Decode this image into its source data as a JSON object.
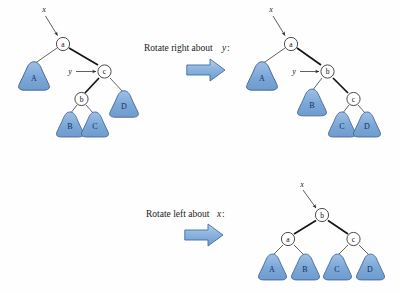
{
  "figure": {
    "background_color": "#ffffff",
    "subtree_fill_color": "#7ba7d7",
    "subtree_stroke_color": "#3c5f90",
    "arrow_fill_color": "#8cb4de",
    "arrow_stroke_color": "#3f6ea8",
    "node_fill_color": "#ffffff",
    "node_stroke_color": "#2e2e2e"
  },
  "captions": {
    "step1": "Rotate right about",
    "step1_var": "y",
    "step1_colon": ":",
    "step1_full": "Rotate right about y:",
    "step2": "Rotate left about",
    "step2_var": "x",
    "step2_colon": ":",
    "step2_full": "Rotate left about x:"
  },
  "trees": {
    "before": {
      "name": "initial-tree",
      "pointers": [
        {
          "label": "x",
          "target": "a"
        },
        {
          "label": "y",
          "target": "c"
        }
      ],
      "nodes": [
        {
          "id": "a",
          "label": "a"
        },
        {
          "id": "c",
          "label": "c"
        },
        {
          "id": "b",
          "label": "b"
        }
      ],
      "subtrees": [
        {
          "id": "A",
          "label": "A"
        },
        {
          "id": "B",
          "label": "B"
        },
        {
          "id": "C",
          "label": "C"
        },
        {
          "id": "D",
          "label": "D"
        }
      ]
    },
    "after_right": {
      "name": "after-right-rotation-tree",
      "pointers": [
        {
          "label": "x",
          "target": "a"
        },
        {
          "label": "y",
          "target": "b"
        }
      ],
      "nodes": [
        {
          "id": "a",
          "label": "a"
        },
        {
          "id": "b",
          "label": "b"
        },
        {
          "id": "c",
          "label": "c"
        }
      ],
      "subtrees": [
        {
          "id": "A",
          "label": "A"
        },
        {
          "id": "B",
          "label": "B"
        },
        {
          "id": "C",
          "label": "C"
        },
        {
          "id": "D",
          "label": "D"
        }
      ]
    },
    "after_left": {
      "name": "after-left-rotation-tree",
      "pointers": [
        {
          "label": "x",
          "target": "b"
        }
      ],
      "nodes": [
        {
          "id": "b",
          "label": "b"
        },
        {
          "id": "a",
          "label": "a"
        },
        {
          "id": "c",
          "label": "c"
        }
      ],
      "subtrees": [
        {
          "id": "A",
          "label": "A"
        },
        {
          "id": "B",
          "label": "B"
        },
        {
          "id": "C",
          "label": "C"
        },
        {
          "id": "D",
          "label": "D"
        }
      ]
    }
  }
}
